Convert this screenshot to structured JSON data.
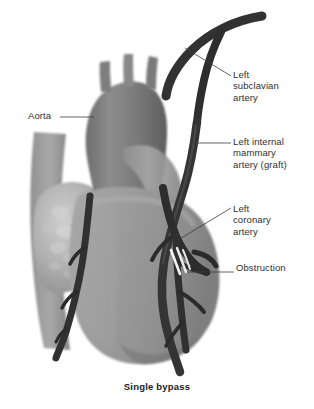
{
  "figure": {
    "title": "Single bypass",
    "alt_name": "coronary-artery-bypass-graft-illustration",
    "background_color": "#ffffff",
    "vessel_color": "#3a3a3a",
    "heart_color": "#9a9a9a",
    "aorta_color": "#7d7d7d",
    "obstruction_color": "#f2f2f2",
    "leader_color": "#3c3c3c"
  },
  "labels": {
    "subclavian": "Left\nsubclavian\nartery",
    "mammary": "Left internal\nmammary\nartery (graft)",
    "coronary": "Left\ncoronary\nartery",
    "obstruction": "Obstruction",
    "aorta": "Aorta"
  },
  "caption": {
    "text": "Single bypass"
  }
}
